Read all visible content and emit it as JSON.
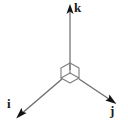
{
  "figure": {
    "background_color": "#ffffff",
    "line_color": "#8a8a8a",
    "cube_color": "#7a7a7a",
    "arrowhead_color": "#1a1a1a",
    "label_color": "#1a1a1a",
    "origin": {
      "x": 70,
      "y": 73
    },
    "cube": {
      "name": "unit-cube",
      "half_width": 9,
      "half_height": 5,
      "vertical_edge": 5
    },
    "axes": [
      {
        "id": "k",
        "label": "k",
        "description": "vertical axis pointing up",
        "from": {
          "x": 70,
          "y": 68
        },
        "to": {
          "x": 70,
          "y": 6
        },
        "label_position": {
          "x": 74,
          "y": 1
        }
      },
      {
        "id": "i",
        "label": "i",
        "description": "axis pointing down and to the left",
        "from": {
          "x": 62,
          "y": 78
        },
        "to": {
          "x": 18,
          "y": 117
        },
        "label_position": {
          "x": 7,
          "y": 97
        }
      },
      {
        "id": "j",
        "label": "j",
        "description": "axis pointing down and to the right",
        "from": {
          "x": 78,
          "y": 78
        },
        "to": {
          "x": 114,
          "y": 102
        },
        "label_position": {
          "x": 110,
          "y": 104
        }
      }
    ]
  }
}
